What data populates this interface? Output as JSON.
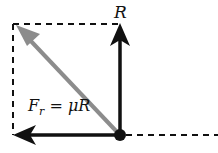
{
  "diagram": {
    "labels": {
      "normal_force": "R",
      "friction_main": "F",
      "friction_sub": "r",
      "friction_rhs": " = μR"
    },
    "colors": {
      "arrow": "#111111",
      "resultant": "#8c8c8c",
      "dashed": "#111111"
    }
  }
}
